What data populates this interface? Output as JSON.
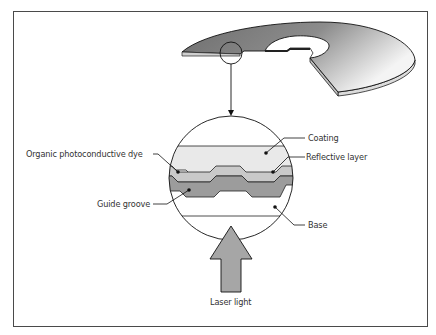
{
  "diagram": {
    "labels": {
      "coating": "Coating",
      "reflective_layer": "Reflective layer",
      "dye": "Organic photoconductive dye",
      "guide_groove": "Guide groove",
      "base": "Base",
      "laser_light": "Laser light"
    },
    "colors": {
      "disc_fill_dark": "#7a7a7a",
      "disc_fill_light": "#f2f2f2",
      "coating": "#e8e8e8",
      "reflective": "#c8c8c8",
      "dye": "#9a9a9a",
      "arrow": "#a6a6a6",
      "stroke": "#222222",
      "frame": "#4a4a4a"
    },
    "elements": [
      {
        "id": "disc",
        "desc": "cutaway optical disc shown in perspective"
      },
      {
        "id": "magnifier-circle-small",
        "desc": "small circle on disc edge indicating zoom region"
      },
      {
        "id": "pointer-arrow",
        "desc": "arrow from small circle down to enlarged cross-section"
      },
      {
        "id": "cross-section-circle",
        "desc": "enlarged cross-section of layers"
      },
      {
        "id": "laser-arrow",
        "desc": "large upward arrow representing laser light"
      }
    ]
  }
}
